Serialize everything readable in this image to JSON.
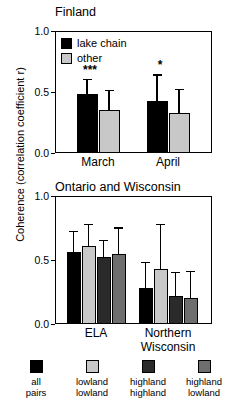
{
  "axis": {
    "ylabel": "Coherence (correlation coefficient r)",
    "yticks": [
      "1.0",
      "0.5",
      "0.0"
    ]
  },
  "panels": [
    {
      "title": "Finland",
      "legend": [
        {
          "label": "lake chain",
          "color": "#000000"
        },
        {
          "label": "other",
          "color": "#C8C8C8"
        }
      ],
      "groups": [
        {
          "label": "March"
        },
        {
          "label": "April"
        }
      ]
    },
    {
      "title": "Ontario and Wisconsin",
      "groups": [
        {
          "label": "ELA"
        },
        {
          "label": "Northern",
          "label2": "Wisconsin"
        }
      ]
    }
  ],
  "bottom_legend": [
    {
      "label1": "all",
      "label2": "pairs",
      "color": "#000000"
    },
    {
      "label1": "lowland",
      "label2": "lowland",
      "color": "#C8C8C8"
    },
    {
      "label1": "highland",
      "label2": "highland",
      "color": "#2A2A2A"
    },
    {
      "label1": "highland",
      "label2": "lowland",
      "color": "#6E6E6E"
    }
  ],
  "chart_data": [
    {
      "type": "bar",
      "title": "Finland",
      "xlabel": "",
      "ylabel": "Coherence (correlation coefficient r)",
      "ylim": [
        0.0,
        1.0
      ],
      "yticks": [
        0.0,
        0.5,
        1.0
      ],
      "grid": false,
      "legend_position": "inside-top-left",
      "categories": [
        "March",
        "April"
      ],
      "series": [
        {
          "name": "lake chain",
          "color": "#000000",
          "values": [
            0.48,
            0.43
          ],
          "errors": [
            0.12,
            0.21
          ]
        },
        {
          "name": "other",
          "color": "#C8C8C8",
          "values": [
            0.35,
            0.33
          ],
          "errors": [
            0.16,
            0.19
          ]
        }
      ],
      "annotations": [
        {
          "text": "***",
          "category": "March",
          "meaning": "p < 0.001"
        },
        {
          "text": "*",
          "category": "April",
          "meaning": "p < 0.05"
        }
      ]
    },
    {
      "type": "bar",
      "title": "Ontario and Wisconsin",
      "xlabel": "",
      "ylabel": "Coherence (correlation coefficient r)",
      "ylim": [
        0.0,
        1.0
      ],
      "yticks": [
        0.0,
        0.5,
        1.0
      ],
      "grid": false,
      "legend_position": "below-figure",
      "categories": [
        "ELA",
        "Northern Wisconsin"
      ],
      "series": [
        {
          "name": "all pairs",
          "color": "#000000",
          "values": [
            0.56,
            0.28
          ],
          "errors": [
            0.16,
            0.2
          ]
        },
        {
          "name": "lowland lowland",
          "color": "#C8C8C8",
          "values": [
            0.61,
            0.43
          ],
          "errors": [
            0.17,
            0.35
          ]
        },
        {
          "name": "highland highland",
          "color": "#2A2A2A",
          "values": [
            0.52,
            0.22
          ],
          "errors": [
            0.13,
            0.18
          ]
        },
        {
          "name": "highland lowland",
          "color": "#6E6E6E",
          "values": [
            0.55,
            0.2
          ],
          "errors": [
            0.2,
            0.21
          ]
        }
      ],
      "annotations": []
    }
  ]
}
